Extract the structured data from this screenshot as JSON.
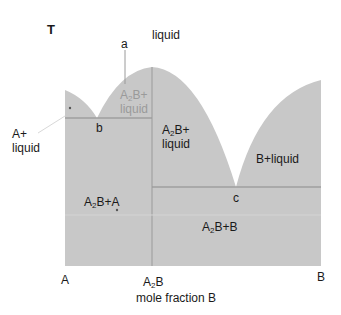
{
  "diagram": {
    "type": "binary phase diagram with compound formation",
    "axis": {
      "y_label": "T",
      "x_label": "mole fraction B",
      "x_ticks": [
        "A",
        "A2B",
        "B"
      ]
    },
    "colors": {
      "two_phase_fill": "#c8c8c8",
      "lines": "#8a8a8a",
      "text": "#1a1a1a",
      "faint_text": "#9a9a9a"
    },
    "regions": {
      "liquid": "liquid",
      "a_plus_liquid_1": "A+",
      "a_plus_liquid_2": "liquid",
      "a2b_liquid_left_1": "A",
      "a2b_liquid_left_sub": "2",
      "a2b_liquid_left_2": "B+",
      "a2b_liquid_left_3": "liquid",
      "a2b_liquid_right_1": "A",
      "a2b_liquid_right_sub": "2",
      "a2b_liquid_right_2": "B+",
      "a2b_liquid_right_3": "liquid",
      "b_plus_liquid": "B+liquid",
      "a2b_plus_a_1": "A",
      "a2b_plus_a_sub": "2",
      "a2b_plus_a_2": "B+A",
      "a2b_plus_b_1": "A",
      "a2b_plus_b_sub": "2",
      "a2b_plus_b_2": "B+B"
    },
    "points": {
      "a": "a",
      "b": "b",
      "c": "c"
    },
    "tick_labels": {
      "A": "A",
      "A2B_main": "A",
      "A2B_sub": "2",
      "A2B_tail": "B",
      "B": "B"
    }
  }
}
